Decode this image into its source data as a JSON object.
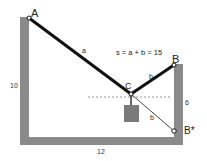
{
  "diagram": {
    "equation": "s = a + b = 15",
    "points": {
      "A": {
        "label": "A",
        "x": 29,
        "y": 18
      },
      "B": {
        "label": "B",
        "x": 174,
        "y": 65
      },
      "C": {
        "label": "C",
        "x": 131,
        "y": 94
      },
      "B_star": {
        "label": "B*",
        "x": 174,
        "y": 131
      }
    },
    "segments": {
      "a": {
        "label": "a"
      },
      "b_upper": {
        "label": "b"
      },
      "b_reflected": {
        "label": "b"
      }
    },
    "dimensions": {
      "left_height": "10",
      "bottom_width": "12",
      "right_height": "6"
    },
    "colors": {
      "wall": "#8a8a8a",
      "rope": "#111111",
      "weight": "#7a7a7a",
      "dashed": "#999999",
      "background": "#ffffff"
    }
  }
}
